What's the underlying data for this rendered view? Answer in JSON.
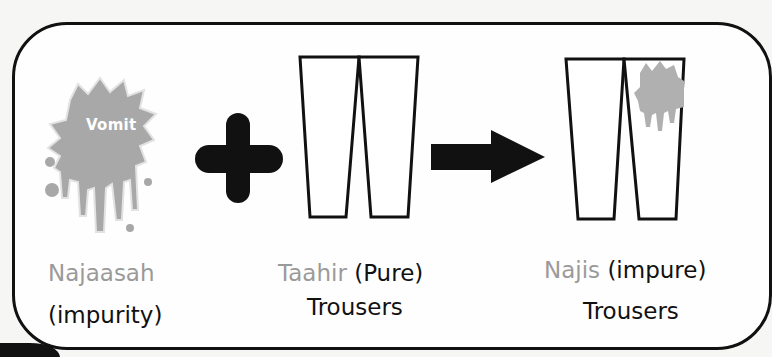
{
  "diagram": {
    "impurity": {
      "splat_label": "Vomit",
      "term": "Najaasah",
      "meaning": "(impurity)",
      "splat_color": "#a8a8a8"
    },
    "operator_plus": "plus-icon",
    "pure_item": {
      "term": "Taahir",
      "meaning": "(Pure)",
      "object": "Trousers"
    },
    "operator_arrow": "arrow-right-icon",
    "impure_item": {
      "term": "Najis",
      "meaning": "(impure)",
      "object": "Trousers",
      "stain_color": "#b0b0b0"
    },
    "colors": {
      "outline": "#111111",
      "term_grey": "#9a9a9a",
      "text": "#111111"
    }
  }
}
